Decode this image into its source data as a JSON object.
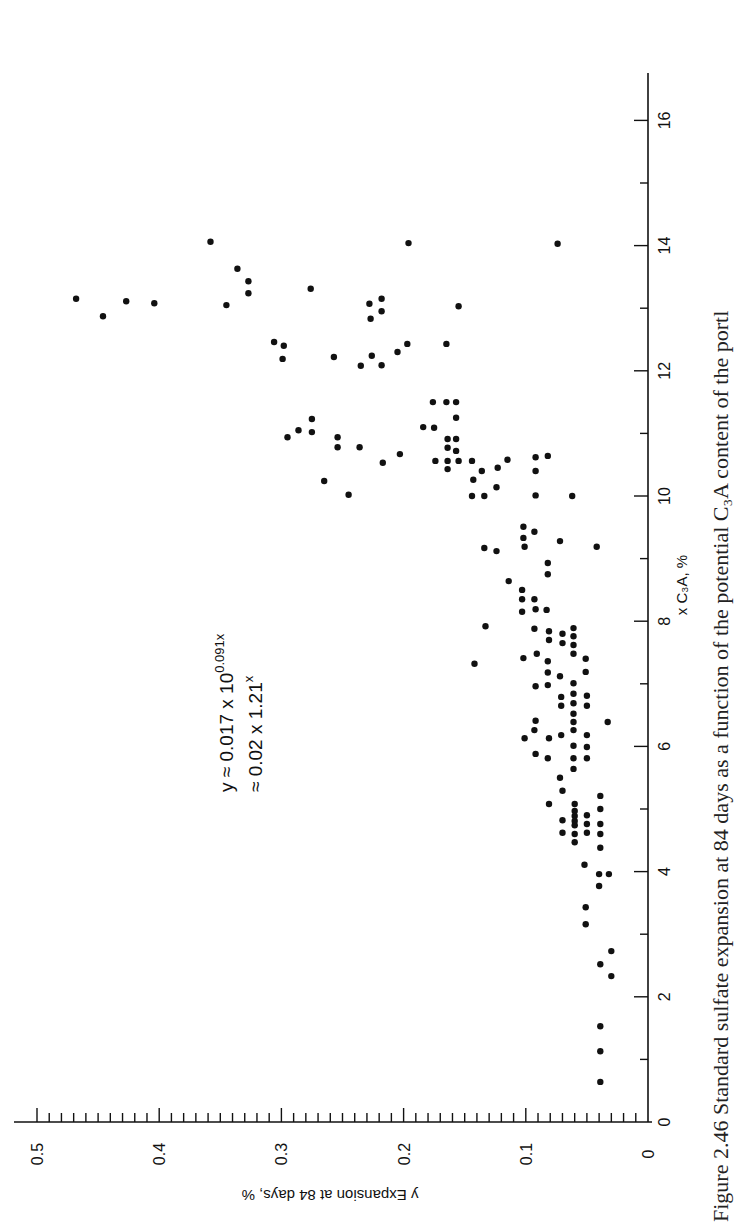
{
  "figure": {
    "caption": "Figure 2.46 Standard sulfate expansion at 84 days as a function of the potential C₃A content of the portl",
    "orientation": "rotated 90° counter-clockwise",
    "equation_line1": "y ≈ 0.017 x 10",
    "equation_line1_exp": "0.091x",
    "equation_line2": "≈ 0.02 x 1.21",
    "equation_line2_exp": "x"
  },
  "chart_data": {
    "type": "scatter",
    "title": "",
    "xlabel": "x C₃A, %",
    "ylabel": "y Expansion at 84 days, %",
    "xlim": [
      0,
      16.5
    ],
    "ylim": [
      0,
      0.5
    ],
    "x_major_ticks": [
      0,
      2,
      4,
      6,
      8,
      10,
      12,
      14,
      16
    ],
    "x_minor_ticks": [
      1,
      3,
      5,
      7,
      9,
      11,
      13,
      15
    ],
    "y_major_ticks": [
      0,
      0.1,
      0.2,
      0.3,
      0.4,
      0.5
    ],
    "y_minor_step": 0.01,
    "x_tick_labels": [
      "0",
      "2",
      "4",
      "6",
      "8",
      "10",
      "12",
      "14",
      "16"
    ],
    "y_tick_labels": [
      "0",
      "0.1",
      "0.2",
      "0.3",
      "0.4",
      "0.5"
    ],
    "grid": false,
    "legend": null,
    "annotations": [
      "y ≈ 0.017 x 10^(0.091x)",
      "≈ 0.02 x 1.21^x"
    ],
    "fit": {
      "form": "y = 0.017 * 10^(0.091x) ≈ 0.02 * 1.21^x"
    },
    "series": [
      {
        "name": "Expansion vs C3A",
        "points": [
          [
            0.64,
            0.039
          ],
          [
            1.13,
            0.039
          ],
          [
            1.53,
            0.039
          ],
          [
            2.33,
            0.03
          ],
          [
            2.52,
            0.039
          ],
          [
            2.73,
            0.03
          ],
          [
            3.16,
            0.051
          ],
          [
            3.43,
            0.051
          ],
          [
            3.77,
            0.04
          ],
          [
            3.96,
            0.04
          ],
          [
            3.96,
            0.032
          ],
          [
            4.11,
            0.052
          ],
          [
            4.38,
            0.039
          ],
          [
            4.47,
            0.06
          ],
          [
            4.6,
            0.06
          ],
          [
            4.6,
            0.039
          ],
          [
            4.62,
            0.07
          ],
          [
            4.62,
            0.05
          ],
          [
            4.74,
            0.06
          ],
          [
            4.76,
            0.05
          ],
          [
            4.76,
            0.039
          ],
          [
            4.81,
            0.06
          ],
          [
            4.82,
            0.07
          ],
          [
            4.89,
            0.06
          ],
          [
            4.9,
            0.05
          ],
          [
            4.97,
            0.06
          ],
          [
            5.0,
            0.039
          ],
          [
            5.08,
            0.081
          ],
          [
            5.08,
            0.06
          ],
          [
            5.21,
            0.039
          ],
          [
            5.29,
            0.07
          ],
          [
            5.5,
            0.072
          ],
          [
            5.64,
            0.061
          ],
          [
            5.81,
            0.082
          ],
          [
            5.81,
            0.061
          ],
          [
            5.81,
            0.05
          ],
          [
            5.88,
            0.092
          ],
          [
            5.99,
            0.05
          ],
          [
            6.01,
            0.061
          ],
          [
            6.13,
            0.101
          ],
          [
            6.13,
            0.081
          ],
          [
            6.18,
            0.071
          ],
          [
            6.18,
            0.05
          ],
          [
            6.26,
            0.093
          ],
          [
            6.26,
            0.061
          ],
          [
            6.39,
            0.061
          ],
          [
            6.39,
            0.033
          ],
          [
            6.41,
            0.092
          ],
          [
            6.52,
            0.061
          ],
          [
            6.65,
            0.071
          ],
          [
            6.65,
            0.05
          ],
          [
            6.69,
            0.061
          ],
          [
            6.79,
            0.071
          ],
          [
            6.81,
            0.05
          ],
          [
            6.84,
            0.061
          ],
          [
            6.96,
            0.092
          ],
          [
            6.98,
            0.082
          ],
          [
            7.01,
            0.061
          ],
          [
            7.12,
            0.072
          ],
          [
            7.18,
            0.082
          ],
          [
            7.19,
            0.051
          ],
          [
            7.32,
            0.142
          ],
          [
            7.36,
            0.082
          ],
          [
            7.4,
            0.051
          ],
          [
            7.41,
            0.102
          ],
          [
            7.48,
            0.091
          ],
          [
            7.48,
            0.061
          ],
          [
            7.62,
            0.061
          ],
          [
            7.65,
            0.07
          ],
          [
            7.7,
            0.081
          ],
          [
            7.76,
            0.061
          ],
          [
            7.8,
            0.07
          ],
          [
            7.84,
            0.081
          ],
          [
            7.88,
            0.093
          ],
          [
            7.89,
            0.061
          ],
          [
            7.92,
            0.133
          ],
          [
            8.15,
            0.103
          ],
          [
            8.19,
            0.092
          ],
          [
            8.18,
            0.083
          ],
          [
            8.35,
            0.103
          ],
          [
            8.35,
            0.093
          ],
          [
            8.5,
            0.103
          ],
          [
            8.64,
            0.114
          ],
          [
            8.75,
            0.082
          ],
          [
            8.93,
            0.082
          ],
          [
            9.12,
            0.124
          ],
          [
            9.17,
            0.134
          ],
          [
            9.19,
            0.101
          ],
          [
            9.19,
            0.042
          ],
          [
            9.28,
            0.072
          ],
          [
            9.33,
            0.102
          ],
          [
            9.43,
            0.093
          ],
          [
            9.51,
            0.102
          ],
          [
            10.0,
            0.144
          ],
          [
            10.0,
            0.134
          ],
          [
            10.01,
            0.092
          ],
          [
            10.0,
            0.062
          ],
          [
            10.02,
            0.245
          ],
          [
            10.14,
            0.124
          ],
          [
            10.24,
            0.265
          ],
          [
            10.26,
            0.143
          ],
          [
            10.4,
            0.136
          ],
          [
            10.4,
            0.092
          ],
          [
            10.43,
            0.164
          ],
          [
            10.45,
            0.123
          ],
          [
            10.53,
            0.217
          ],
          [
            10.56,
            0.174
          ],
          [
            10.56,
            0.164
          ],
          [
            10.56,
            0.155
          ],
          [
            10.56,
            0.144
          ],
          [
            10.58,
            0.115
          ],
          [
            10.62,
            0.092
          ],
          [
            10.64,
            0.082
          ],
          [
            10.67,
            0.203
          ],
          [
            10.72,
            0.157
          ],
          [
            10.77,
            0.164
          ],
          [
            10.78,
            0.254
          ],
          [
            10.78,
            0.236
          ],
          [
            10.91,
            0.164
          ],
          [
            10.91,
            0.157
          ],
          [
            10.94,
            0.295
          ],
          [
            10.94,
            0.254
          ],
          [
            11.02,
            0.275
          ],
          [
            11.05,
            0.286
          ],
          [
            11.09,
            0.175
          ],
          [
            11.1,
            0.184
          ],
          [
            11.23,
            0.275
          ],
          [
            11.25,
            0.157
          ],
          [
            11.5,
            0.176
          ],
          [
            11.5,
            0.165
          ],
          [
            11.5,
            0.157
          ],
          [
            12.08,
            0.235
          ],
          [
            12.09,
            0.218
          ],
          [
            12.19,
            0.299
          ],
          [
            12.22,
            0.257
          ],
          [
            12.24,
            0.226
          ],
          [
            12.3,
            0.205
          ],
          [
            12.4,
            0.298
          ],
          [
            12.43,
            0.197
          ],
          [
            12.43,
            0.165
          ],
          [
            12.46,
            0.306
          ],
          [
            12.83,
            0.227
          ],
          [
            12.87,
            0.446
          ],
          [
            12.95,
            0.218
          ],
          [
            13.03,
            0.155
          ],
          [
            13.05,
            0.345
          ],
          [
            13.07,
            0.228
          ],
          [
            13.08,
            0.404
          ],
          [
            13.11,
            0.427
          ],
          [
            13.15,
            0.468
          ],
          [
            13.15,
            0.218
          ],
          [
            13.24,
            0.327
          ],
          [
            13.31,
            0.276
          ],
          [
            13.43,
            0.327
          ],
          [
            13.63,
            0.336
          ],
          [
            14.03,
            0.074
          ],
          [
            14.04,
            0.196
          ],
          [
            14.06,
            0.358
          ]
        ]
      }
    ]
  }
}
